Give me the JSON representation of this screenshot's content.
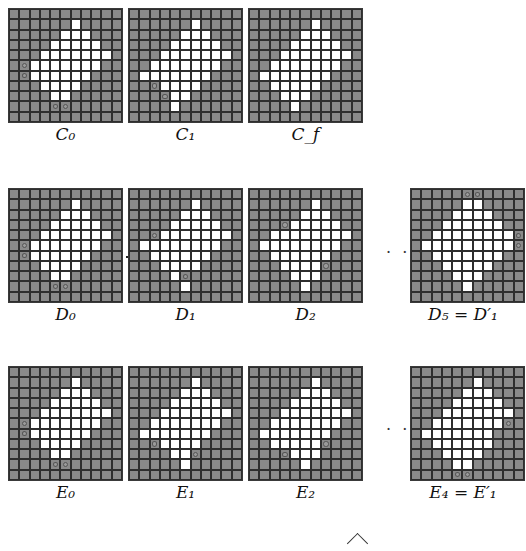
{
  "figure": {
    "grid_size": 11,
    "colors": {
      "background": "#ffffff",
      "grid_cell": "#8a8a8a",
      "white_cell": "#ffffff",
      "grid_lines": "#2e2e2e"
    },
    "ellipsis": "· · ·",
    "panels": [
      {
        "id": "C0",
        "label": "C",
        "sub": "0",
        "prime": "",
        "prefix": "",
        "x": 8,
        "y": 8,
        "lx": 8,
        "ly": 122,
        "white": {
          "1": [
            6
          ],
          "2": [
            5,
            6,
            7
          ],
          "3": [
            4,
            5,
            6,
            7,
            8
          ],
          "4": [
            3,
            4,
            5,
            6,
            7,
            8,
            9
          ],
          "5": [
            2,
            3,
            4,
            5,
            6,
            7,
            8
          ],
          "6": [
            2,
            3,
            4,
            5,
            6,
            7
          ],
          "7": [
            3,
            4,
            5,
            6
          ],
          "8": [
            4,
            5
          ]
        },
        "circles": [
          [
            5,
            1
          ],
          [
            6,
            1
          ],
          [
            9,
            4
          ],
          [
            9,
            5
          ]
        ]
      },
      {
        "id": "C1",
        "label": "C",
        "sub": "1",
        "prime": "",
        "prefix": "",
        "x": 128,
        "y": 8,
        "lx": 128,
        "ly": 122,
        "white": {
          "1": [
            6
          ],
          "2": [
            5,
            6,
            7
          ],
          "3": [
            4,
            5,
            6,
            7,
            8
          ],
          "4": [
            3,
            4,
            5,
            6,
            7,
            8,
            9
          ],
          "5": [
            2,
            3,
            4,
            5,
            6,
            7,
            8
          ],
          "6": [
            1,
            2,
            3,
            4,
            5,
            6,
            7
          ],
          "7": [
            3,
            4,
            5,
            6
          ],
          "8": [
            4,
            5
          ],
          "9": [
            4
          ]
        },
        "circles": [
          [
            7,
            2
          ],
          [
            8,
            3
          ]
        ]
      },
      {
        "id": "Cf",
        "label": "C",
        "sub": "f",
        "prime": "",
        "prefix": "",
        "x": 248,
        "y": 8,
        "lx": 248,
        "ly": 122,
        "white": {
          "1": [
            6
          ],
          "2": [
            5,
            6,
            7
          ],
          "3": [
            4,
            5,
            6,
            7,
            8
          ],
          "4": [
            3,
            4,
            5,
            6,
            7,
            8,
            9
          ],
          "5": [
            2,
            3,
            4,
            5,
            6,
            7,
            8
          ],
          "6": [
            1,
            2,
            3,
            4,
            5,
            6,
            7
          ],
          "7": [
            2,
            3,
            4,
            5,
            6
          ],
          "8": [
            3,
            4,
            5
          ],
          "9": [
            4
          ]
        },
        "circles": []
      },
      {
        "id": "D0",
        "label": "D",
        "sub": "0",
        "prime": "",
        "prefix": "",
        "x": 8,
        "y": 188,
        "lx": 8,
        "ly": 302,
        "white": {
          "1": [
            6
          ],
          "2": [
            5,
            6,
            7
          ],
          "3": [
            4,
            5,
            6,
            7,
            8
          ],
          "4": [
            3,
            4,
            5,
            6,
            7,
            8,
            9
          ],
          "5": [
            2,
            3,
            4,
            5,
            6,
            7,
            8
          ],
          "6": [
            2,
            3,
            4,
            5,
            6,
            7
          ],
          "7": [
            3,
            4,
            5,
            6
          ],
          "8": [
            4,
            5
          ]
        },
        "circles": [
          [
            5,
            1
          ],
          [
            6,
            1
          ],
          [
            9,
            4
          ],
          [
            9,
            5
          ]
        ]
      },
      {
        "id": "D1",
        "label": "D",
        "sub": "1",
        "prime": "",
        "prefix": "",
        "x": 128,
        "y": 188,
        "lx": 128,
        "ly": 302,
        "white": {
          "1": [
            6
          ],
          "2": [
            5,
            6,
            7
          ],
          "3": [
            4,
            5,
            6,
            7,
            8
          ],
          "4": [
            3,
            4,
            5,
            6,
            7,
            8,
            9
          ],
          "5": [
            1,
            2,
            3,
            4,
            5,
            6,
            7,
            8
          ],
          "6": [
            2,
            3,
            4,
            5,
            6,
            7
          ],
          "7": [
            3,
            4,
            5,
            6
          ],
          "8": [
            4
          ],
          "9": [
            5
          ]
        },
        "circles": [
          [
            4,
            2
          ],
          [
            8,
            5
          ]
        ]
      },
      {
        "id": "D2",
        "label": "D",
        "sub": "2",
        "prime": "",
        "prefix": "",
        "x": 248,
        "y": 188,
        "lx": 248,
        "ly": 302,
        "white": {
          "1": [
            6
          ],
          "2": [
            5,
            6,
            7
          ],
          "3": [
            4,
            5,
            6,
            7,
            8
          ],
          "4": [
            2,
            3,
            4,
            5,
            6,
            7,
            8,
            9
          ],
          "5": [
            1,
            2,
            3,
            4,
            5,
            6,
            7,
            8
          ],
          "6": [
            2,
            3,
            4,
            5,
            6,
            7
          ],
          "7": [
            3,
            4,
            5,
            6
          ],
          "8": [
            4,
            5,
            6
          ],
          "9": [
            5
          ]
        },
        "circles": [
          [
            3,
            3
          ],
          [
            7,
            7
          ]
        ]
      },
      {
        "id": "D5",
        "label": "D",
        "sub": "5",
        "prime": "D",
        "prefix": "",
        "x": 410,
        "y": 188,
        "lx": 400,
        "ly": 302,
        "white": {
          "1": [
            5,
            6
          ],
          "2": [
            4,
            5,
            6,
            7
          ],
          "3": [
            3,
            4,
            5,
            6,
            7,
            8
          ],
          "4": [
            2,
            3,
            4,
            5,
            6,
            7,
            8,
            9
          ],
          "5": [
            1,
            2,
            3,
            4,
            5,
            6,
            7,
            8,
            9
          ],
          "6": [
            2,
            3,
            4,
            5,
            6,
            7,
            8
          ],
          "7": [
            3,
            4,
            5,
            6,
            7
          ],
          "8": [
            4,
            5,
            6
          ],
          "9": [
            5
          ]
        },
        "circles": [
          [
            0,
            5
          ],
          [
            0,
            6
          ],
          [
            4,
            10
          ],
          [
            5,
            10
          ]
        ]
      },
      {
        "id": "E0",
        "label": "E",
        "sub": "0",
        "prime": "",
        "prefix": "",
        "x": 8,
        "y": 366,
        "lx": 8,
        "ly": 480,
        "white": {
          "1": [
            6
          ],
          "2": [
            5,
            6,
            7
          ],
          "3": [
            4,
            5,
            6,
            7,
            8
          ],
          "4": [
            3,
            4,
            5,
            6,
            7,
            8,
            9
          ],
          "5": [
            2,
            3,
            4,
            5,
            6,
            7,
            8
          ],
          "6": [
            2,
            3,
            4,
            5,
            6,
            7
          ],
          "7": [
            3,
            4,
            5,
            6
          ],
          "8": [
            4,
            5
          ]
        },
        "circles": [
          [
            5,
            1
          ],
          [
            6,
            1
          ],
          [
            9,
            4
          ],
          [
            9,
            5
          ]
        ]
      },
      {
        "id": "E1",
        "label": "E",
        "sub": "1",
        "prime": "",
        "prefix": "",
        "x": 128,
        "y": 366,
        "lx": 128,
        "ly": 480,
        "white": {
          "1": [
            6
          ],
          "2": [
            5,
            6,
            7
          ],
          "3": [
            4,
            5,
            6,
            7,
            8
          ],
          "4": [
            3,
            4,
            5,
            6,
            7,
            8,
            9
          ],
          "5": [
            2,
            3,
            4,
            5,
            6,
            7,
            8
          ],
          "6": [
            1,
            2,
            3,
            4,
            5,
            6,
            7
          ],
          "7": [
            3,
            4,
            5,
            6
          ],
          "8": [
            4,
            5
          ],
          "9": [
            5
          ]
        },
        "circles": [
          [
            7,
            2
          ],
          [
            8,
            6
          ]
        ]
      },
      {
        "id": "E2",
        "label": "E",
        "sub": "2",
        "prime": "",
        "prefix": "",
        "x": 248,
        "y": 366,
        "lx": 248,
        "ly": 480,
        "white": {
          "1": [
            6
          ],
          "2": [
            5,
            6,
            7
          ],
          "3": [
            4,
            5,
            6,
            7,
            8
          ],
          "4": [
            3,
            4,
            5,
            6,
            7,
            8,
            9
          ],
          "5": [
            2,
            3,
            4,
            5,
            6,
            7,
            8
          ],
          "6": [
            1,
            2,
            3,
            4,
            5,
            6,
            7
          ],
          "7": [
            2,
            3,
            4,
            5,
            6
          ],
          "8": [
            4,
            5,
            6
          ],
          "9": [
            5
          ]
        },
        "circles": [
          [
            7,
            7
          ],
          [
            8,
            3
          ]
        ]
      },
      {
        "id": "E4",
        "label": "E",
        "sub": "4",
        "prime": "E",
        "prefix": "",
        "x": 410,
        "y": 366,
        "lx": 400,
        "ly": 480,
        "white": {
          "1": [
            6
          ],
          "2": [
            5,
            6,
            7
          ],
          "3": [
            4,
            5,
            6,
            7,
            8
          ],
          "4": [
            3,
            4,
            5,
            6,
            7,
            8,
            9
          ],
          "5": [
            2,
            3,
            4,
            5,
            6,
            7,
            8
          ],
          "6": [
            1,
            2,
            3,
            4,
            5,
            6,
            7
          ],
          "7": [
            2,
            3,
            4,
            5,
            6,
            7
          ],
          "8": [
            3,
            4,
            5,
            6
          ],
          "9": [
            4,
            5
          ]
        },
        "circles": [
          [
            5,
            9
          ],
          [
            10,
            4
          ],
          [
            10,
            5
          ]
        ]
      }
    ],
    "labels": {
      "C0": "C₀",
      "C1": "C₁",
      "Cf": "C_f",
      "D0": "D₀",
      "D1": "D₁",
      "D2": "D₂",
      "D5": "D₅ = D′₁",
      "E0": "E₀",
      "E1": "E₁",
      "E2": "E₂",
      "E4": "E₄ = E′₁"
    },
    "ellipses": [
      {
        "x": 386,
        "y": 243
      },
      {
        "x": 386,
        "y": 420
      }
    ]
  }
}
